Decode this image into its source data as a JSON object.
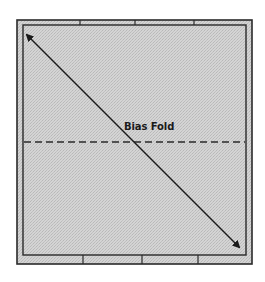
{
  "diagram": {
    "title": "",
    "fold_label": "Bias Fold",
    "colors": {
      "fabric_fill": "#cfcfcf",
      "binding_fill": "#d9d9d9",
      "line": "#2a2a2a",
      "background": "#ffffff"
    },
    "square": {
      "outer": {
        "x": 17,
        "y": 20,
        "w": 235,
        "h": 244
      },
      "inner": {
        "x": 23,
        "y": 25,
        "w": 223,
        "h": 230
      }
    },
    "seam_ticks_top_x": [
      80,
      135,
      194
    ],
    "seam_ticks_bottom_x": [
      83,
      142,
      198
    ],
    "diagonal_arrow": {
      "from": {
        "x": 25,
        "y": 33
      },
      "to": {
        "x": 241,
        "y": 249
      },
      "heads": "both"
    },
    "fold_line": {
      "y": 142,
      "x_start": 24,
      "x_end": 245,
      "style": "dashed"
    },
    "label_position": {
      "x": 124,
      "y": 120
    }
  }
}
